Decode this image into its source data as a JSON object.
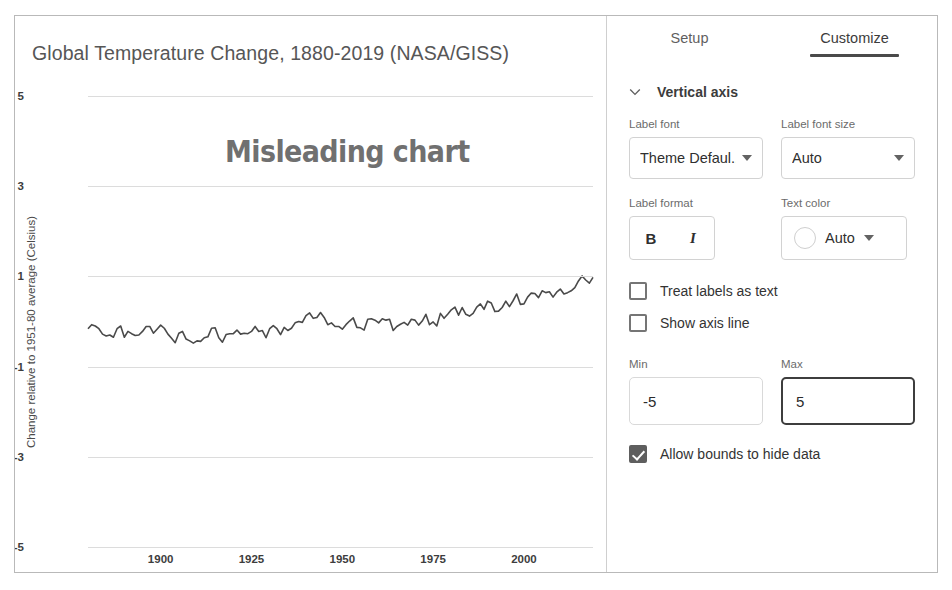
{
  "chart_data": {
    "type": "line",
    "title": "Global Temperature Change, 1880-2019 (NASA/GISS)",
    "xlabel": "",
    "ylabel": "Change relative to 1951-80 average (Celsius)",
    "ylim": [
      -5,
      5
    ],
    "xlim": [
      1880,
      2019
    ],
    "yticks": [
      "5",
      "3",
      "1",
      "-1",
      "-3",
      "-5"
    ],
    "ytick_values": [
      5,
      3,
      1,
      -1,
      -3,
      -5
    ],
    "xticks": [
      "1900",
      "1925",
      "1950",
      "1975",
      "2000"
    ],
    "xtick_values": [
      1900,
      1925,
      1950,
      1975,
      2000
    ],
    "grid": true,
    "legend": "none",
    "annotation": "Misleading chart",
    "line_color": "#4a4a4a",
    "series": [
      {
        "name": "Global mean temperature anomaly",
        "x": [
          1880,
          1881,
          1882,
          1883,
          1884,
          1885,
          1886,
          1887,
          1888,
          1889,
          1890,
          1891,
          1892,
          1893,
          1894,
          1895,
          1896,
          1897,
          1898,
          1899,
          1900,
          1901,
          1902,
          1903,
          1904,
          1905,
          1906,
          1907,
          1908,
          1909,
          1910,
          1911,
          1912,
          1913,
          1914,
          1915,
          1916,
          1917,
          1918,
          1919,
          1920,
          1921,
          1922,
          1923,
          1924,
          1925,
          1926,
          1927,
          1928,
          1929,
          1930,
          1931,
          1932,
          1933,
          1934,
          1935,
          1936,
          1937,
          1938,
          1939,
          1940,
          1941,
          1942,
          1943,
          1944,
          1945,
          1946,
          1947,
          1948,
          1949,
          1950,
          1951,
          1952,
          1953,
          1954,
          1955,
          1956,
          1957,
          1958,
          1959,
          1960,
          1961,
          1962,
          1963,
          1964,
          1965,
          1966,
          1967,
          1968,
          1969,
          1970,
          1971,
          1972,
          1973,
          1974,
          1975,
          1976,
          1977,
          1978,
          1979,
          1980,
          1981,
          1982,
          1983,
          1984,
          1985,
          1986,
          1987,
          1988,
          1989,
          1990,
          1991,
          1992,
          1993,
          1994,
          1995,
          1996,
          1997,
          1998,
          1999,
          2000,
          2001,
          2002,
          2003,
          2004,
          2005,
          2006,
          2007,
          2008,
          2009,
          2010,
          2011,
          2012,
          2013,
          2014,
          2015,
          2016,
          2017,
          2018,
          2019
        ],
        "values": [
          -0.16,
          -0.07,
          -0.1,
          -0.16,
          -0.28,
          -0.32,
          -0.3,
          -0.35,
          -0.16,
          -0.1,
          -0.35,
          -0.22,
          -0.27,
          -0.31,
          -0.3,
          -0.22,
          -0.11,
          -0.11,
          -0.26,
          -0.17,
          -0.08,
          -0.15,
          -0.28,
          -0.37,
          -0.47,
          -0.26,
          -0.22,
          -0.39,
          -0.43,
          -0.48,
          -0.43,
          -0.44,
          -0.36,
          -0.34,
          -0.15,
          -0.14,
          -0.36,
          -0.46,
          -0.29,
          -0.27,
          -0.27,
          -0.19,
          -0.28,
          -0.26,
          -0.27,
          -0.22,
          -0.11,
          -0.22,
          -0.2,
          -0.36,
          -0.16,
          -0.09,
          -0.16,
          -0.29,
          -0.13,
          -0.2,
          -0.15,
          -0.03,
          0.0,
          -0.02,
          0.13,
          0.19,
          0.07,
          0.09,
          0.2,
          0.09,
          -0.07,
          -0.03,
          -0.11,
          -0.11,
          -0.17,
          -0.07,
          0.01,
          0.08,
          -0.13,
          -0.14,
          -0.19,
          0.05,
          0.06,
          0.03,
          -0.03,
          0.06,
          0.03,
          0.05,
          -0.2,
          -0.11,
          -0.06,
          -0.02,
          -0.08,
          0.05,
          0.03,
          -0.08,
          0.01,
          0.16,
          -0.07,
          -0.01,
          -0.1,
          0.18,
          0.07,
          0.16,
          0.26,
          0.32,
          0.14,
          0.31,
          0.16,
          0.12,
          0.18,
          0.32,
          0.39,
          0.27,
          0.45,
          0.41,
          0.22,
          0.23,
          0.31,
          0.45,
          0.33,
          0.46,
          0.61,
          0.38,
          0.39,
          0.54,
          0.63,
          0.62,
          0.53,
          0.68,
          0.64,
          0.66,
          0.54,
          0.65,
          0.72,
          0.61,
          0.64,
          0.68,
          0.75,
          0.9,
          1.01,
          0.92,
          0.85,
          0.98
        ]
      }
    ]
  },
  "chart_panel": {
    "title": "Global Temperature Change, 1880-2019 (NASA/GISS)",
    "y_axis_title": "Change relative to 1951-80 average (Celsius)",
    "annotation": "Misleading chart"
  },
  "sidebar": {
    "tabs": [
      {
        "label": "Setup",
        "active": false
      },
      {
        "label": "Customize",
        "active": true
      }
    ],
    "section": {
      "label": "Vertical axis",
      "expanded": true
    },
    "label_font": {
      "label": "Label font",
      "value": "Theme Defaul..."
    },
    "label_font_size": {
      "label": "Label font size",
      "value": "Auto"
    },
    "label_format": {
      "label": "Label format",
      "bold": "B",
      "italic": "I"
    },
    "text_color": {
      "label": "Text color",
      "value": "Auto",
      "swatch": "#ffffff"
    },
    "checkboxes": [
      {
        "label": "Treat labels as text",
        "checked": false
      },
      {
        "label": "Show axis line",
        "checked": false
      }
    ],
    "min": {
      "label": "Min",
      "value": "-5"
    },
    "max": {
      "label": "Max",
      "value": "5",
      "focused": true
    },
    "allow_bounds": {
      "label": "Allow bounds to hide data",
      "checked": true
    },
    "tooltip": {
      "text": "Max"
    }
  }
}
